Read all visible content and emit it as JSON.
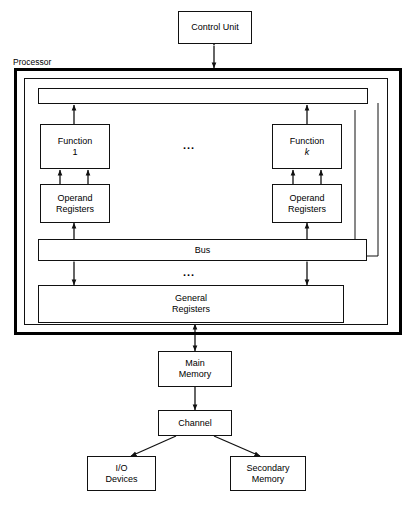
{
  "diagram": {
    "processor_label": "Processor",
    "boxes": {
      "control_unit": "Control Unit",
      "function_1_line1": "Function",
      "function_1_line2": "1",
      "function_k_line1": "Function",
      "function_k_line2": "k",
      "operand_registers_left": "Operand\nRegisters",
      "operand_registers_right": "Operand\nRegisters",
      "bus": "Bus",
      "general_registers": "General\nRegisters",
      "main_memory": "Main\nMemory",
      "channel": "Channel",
      "io_devices": "I/O\nDevices",
      "secondary_memory": "Secondary\nMemory"
    },
    "ellipsis_functions": "...",
    "ellipsis_bus": "...",
    "colors": {
      "stroke": "#111111",
      "thick_stroke": "#000000",
      "background": "#ffffff",
      "text": "#000000"
    }
  }
}
